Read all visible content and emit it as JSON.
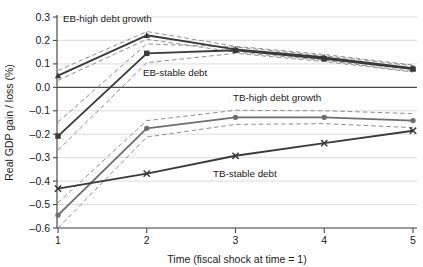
{
  "chart_data": {
    "type": "line",
    "title": "",
    "xlabel": "Time (fiscal shock at time = 1)",
    "ylabel": "Real GDP gain / loss (%)",
    "x": [
      1,
      2,
      3,
      4,
      5
    ],
    "xticklabels": [
      "1",
      "2",
      "3",
      "4",
      "5"
    ],
    "yticklabels": [
      "0.3",
      "0.2",
      "0.1",
      "0.0",
      "-0.1",
      "-0.2",
      "-0.3",
      "-0.4",
      "-0.5",
      "-0.6"
    ],
    "yticks": [
      0.3,
      0.2,
      0.1,
      0.0,
      -0.1,
      -0.2,
      -0.3,
      -0.4,
      -0.5,
      -0.6
    ],
    "ylim": [
      -0.6,
      0.3
    ],
    "xlim": [
      0.85,
      5.15
    ],
    "grid": "horizontal",
    "legend": "inline-annotations",
    "zero_line": 0.0,
    "series": [
      {
        "name": "EB-high debt growth",
        "marker": "triangle",
        "values": [
          0.05,
          0.222,
          0.162,
          0.128,
          0.082
        ],
        "band_upper": [
          0.072,
          0.238,
          0.175,
          0.14,
          0.095
        ],
        "band_lower": [
          0.03,
          0.205,
          0.15,
          0.115,
          0.068
        ]
      },
      {
        "name": "EB-stable debt",
        "marker": "square",
        "values": [
          -0.208,
          0.145,
          0.158,
          0.122,
          0.078
        ],
        "band_upper": [
          -0.148,
          0.185,
          0.172,
          0.135,
          0.092
        ],
        "band_lower": [
          -0.268,
          0.105,
          0.145,
          0.11,
          0.065
        ]
      },
      {
        "name": "TB-high debt growth",
        "marker": "circle",
        "values": [
          -0.545,
          -0.175,
          -0.128,
          -0.128,
          -0.142
        ],
        "band_upper": [
          -0.492,
          -0.142,
          -0.098,
          -0.1,
          -0.112
        ],
        "band_lower": [
          -0.6,
          -0.212,
          -0.158,
          -0.155,
          -0.172
        ]
      },
      {
        "name": "TB-stable debt",
        "marker": "x",
        "values": [
          -0.432,
          -0.368,
          -0.292,
          -0.238,
          -0.185
        ]
      }
    ],
    "annotations": [
      {
        "text": "EB-high debt growth",
        "x_px": 63,
        "y_px": 22
      },
      {
        "text": "EB-stable debt",
        "x_px": 143,
        "y_px": 76
      },
      {
        "text": "TB-high debt growth",
        "x_px": 233,
        "y_px": 101
      },
      {
        "text": "TB-stable debt",
        "x_px": 213,
        "y_px": 177
      }
    ],
    "colors": {
      "line_dark": "#3a3a3a",
      "line_mid": "#6e6e6e",
      "band_dashed": "#8a8a8a",
      "grid": "#d8d8d8",
      "axis": "#4a4a4a",
      "text": "#1a1a1a",
      "background": "#ffffff"
    }
  }
}
